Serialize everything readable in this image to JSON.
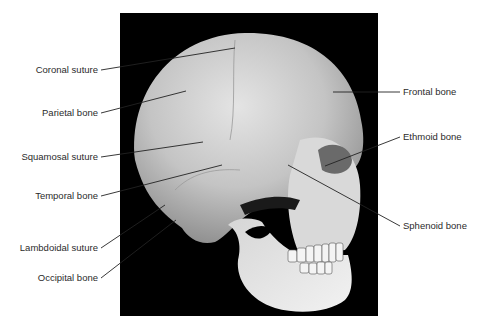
{
  "figure": {
    "background_color": "#000000",
    "leader_color": "#222222",
    "labels_left": [
      {
        "text": "Coronal suture",
        "x": 98,
        "y": 70,
        "tx": 235,
        "ty": 48
      },
      {
        "text": "Parietal bone",
        "x": 98,
        "y": 113,
        "tx": 186,
        "ty": 91
      },
      {
        "text": "Squamosal suture",
        "x": 98,
        "y": 157,
        "tx": 203,
        "ty": 142
      },
      {
        "text": "Temporal bone",
        "x": 98,
        "y": 196,
        "tx": 222,
        "ty": 165
      },
      {
        "text": "Lambdoidal suture",
        "x": 98,
        "y": 248,
        "tx": 165,
        "ty": 205
      },
      {
        "text": "Occipital bone",
        "x": 98,
        "y": 278,
        "tx": 176,
        "ty": 220
      }
    ],
    "labels_right": [
      {
        "text": "Frontal bone",
        "x": 402,
        "y": 92,
        "tx": 333,
        "ty": 92
      },
      {
        "text": "Ethmoid bone",
        "x": 402,
        "y": 137,
        "tx": 325,
        "ty": 166
      },
      {
        "text": "Sphenoid bone",
        "x": 402,
        "y": 226,
        "tx": 288,
        "ty": 165
      }
    ]
  }
}
